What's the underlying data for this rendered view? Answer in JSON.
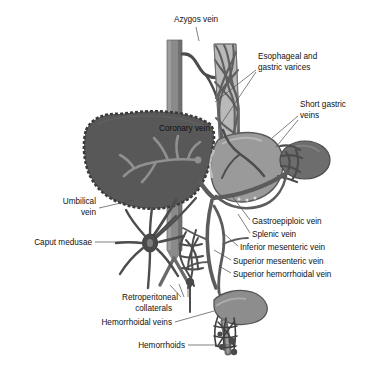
{
  "figure": {
    "background_color": "#ffffff",
    "text_color": "#111111",
    "leader_color": "#4a4a4a"
  },
  "palette": {
    "liver": "#5a5a5a",
    "liver_edge": "#3f3f3f",
    "portal_branch": "#8f8f8f",
    "stomach": "#9a9a9a",
    "stomach_edge": "#5d5d5d",
    "spleen": "#6f6f6f",
    "vessel": "#6a6a6a",
    "vessel_dark": "#4d4d4d",
    "ivc": "#8a8a8a",
    "esophagus": "#b5b5b5",
    "varix": "#6a6a6a",
    "rectum": "#8d8d8d"
  },
  "labels": [
    {
      "id": "azygos-vein",
      "text": "Azygos vein",
      "x": 196,
      "y": 22,
      "align": "middle"
    },
    {
      "id": "esophageal-gastric-varices-1",
      "text": "Esophageal and",
      "x": 258,
      "y": 59,
      "align": "start"
    },
    {
      "id": "esophageal-gastric-varices-2",
      "text": "gastric varices",
      "x": 258,
      "y": 70,
      "align": "start"
    },
    {
      "id": "short-gastric-veins-1",
      "text": "Short gastric",
      "x": 300,
      "y": 107,
      "align": "start"
    },
    {
      "id": "short-gastric-veins-2",
      "text": "veins",
      "x": 300,
      "y": 118,
      "align": "start"
    },
    {
      "id": "coronary-vein",
      "text": "Coronary vein",
      "x": 159,
      "y": 131,
      "align": "start"
    },
    {
      "id": "umbilical-vein-1",
      "text": "Umbilical",
      "x": 96,
      "y": 204,
      "align": "end"
    },
    {
      "id": "umbilical-vein-2",
      "text": "vein",
      "x": 96,
      "y": 215,
      "align": "end"
    },
    {
      "id": "gastroepiploic-vein",
      "text": "Gastroepiploic vein",
      "x": 252,
      "y": 224,
      "align": "start"
    },
    {
      "id": "splenic-vein",
      "text": "Splenic vein",
      "x": 252,
      "y": 237,
      "align": "start"
    },
    {
      "id": "caput-medusae",
      "text": "Caput medusae",
      "x": 92,
      "y": 245,
      "align": "end"
    },
    {
      "id": "inferior-mesenteric-vein",
      "text": "Inferior mesenteric vein",
      "x": 240,
      "y": 250,
      "align": "start"
    },
    {
      "id": "superior-mesenteric-vein",
      "text": "Superior mesenteric vein",
      "x": 233,
      "y": 264,
      "align": "start"
    },
    {
      "id": "superior-hemorrhoidal-vein",
      "text": "Superior hemorrhoidal vein",
      "x": 233,
      "y": 277,
      "align": "start"
    },
    {
      "id": "retroperitoneal-collaterals-1",
      "text": "Retroperitoneal",
      "x": 178,
      "y": 300,
      "align": "end"
    },
    {
      "id": "retroperitoneal-collaterals-2",
      "text": "collaterals",
      "x": 172,
      "y": 311,
      "align": "end"
    },
    {
      "id": "hemorrhoidal-veins",
      "text": "Hemorrhoidal veins",
      "x": 172,
      "y": 325,
      "align": "end"
    },
    {
      "id": "hemorrhoids",
      "text": "Hemorrhoids",
      "x": 185,
      "y": 348,
      "align": "end"
    }
  ],
  "leaders": [
    {
      "id": "leader-azygos",
      "d": "M196,27 L199,41"
    },
    {
      "id": "leader-varices",
      "d": "M256,70 L215,102"
    },
    {
      "id": "leader-varices-b",
      "d": "M256,72 L221,124"
    },
    {
      "id": "leader-short-gastric-a",
      "d": "M298,116 L272,138"
    },
    {
      "id": "leader-short-gastric-b",
      "d": "M298,120 L276,147"
    },
    {
      "id": "leader-umbilical",
      "d": "M99,208 L134,200"
    },
    {
      "id": "leader-caput",
      "d": "M95,242 L138,242"
    },
    {
      "id": "leader-gastroepiploic",
      "d": "M250,220 L232,196"
    },
    {
      "id": "leader-splenic",
      "d": "M250,233 L238,214"
    },
    {
      "id": "leader-inferior-mesenteric",
      "d": "M238,246 L222,232"
    },
    {
      "id": "leader-superior-mesenteric",
      "d": "M231,260 L214,250"
    },
    {
      "id": "leader-superior-hemorrhoidal",
      "d": "M231,273 L219,266"
    },
    {
      "id": "leader-retroperitoneal-a",
      "d": "M181,297 L170,285"
    },
    {
      "id": "leader-retroperitoneal-b",
      "d": "M184,297 L179,284"
    },
    {
      "id": "leader-retroperitoneal-c",
      "d": "M188,297 L188,284"
    },
    {
      "id": "leader-hemorrhoidal-veins",
      "d": "M175,322 L214,311"
    },
    {
      "id": "leader-hemorrhoids",
      "d": "M188,345 L233,345"
    }
  ]
}
